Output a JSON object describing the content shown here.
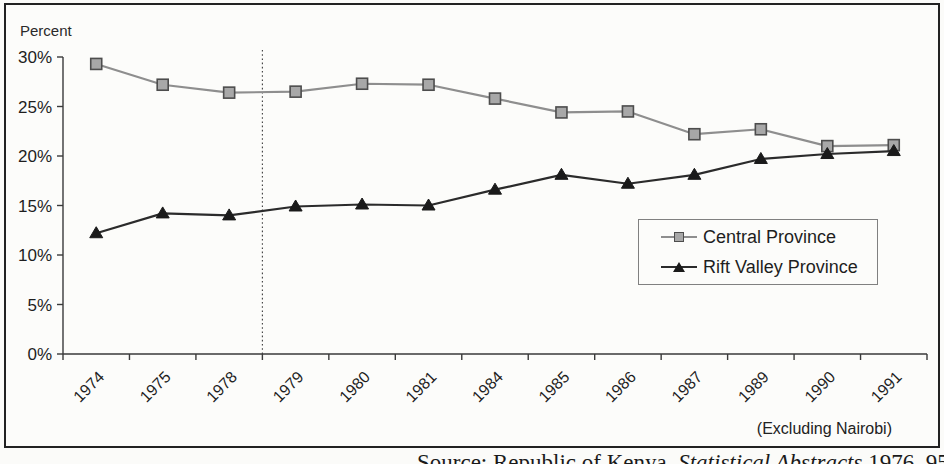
{
  "figure": {
    "y_axis_title": "Percent",
    "excluding_note": "(Excluding Nairobi)",
    "source_prefix": "Source: Republic of Kenya, ",
    "source_italic": "Statistical Abstracts",
    "source_suffix": " 1976–95"
  },
  "chart_data": {
    "type": "line",
    "categories": [
      "1974",
      "1975",
      "1978",
      "1979",
      "1980",
      "1981",
      "1984",
      "1985",
      "1986",
      "1987",
      "1989",
      "1990",
      "1991"
    ],
    "series": [
      {
        "name": "Central Province",
        "marker": "square",
        "line_color": "#8e8e8e",
        "marker_fill": "#a8a8a8",
        "marker_stroke": "#4d4d4d",
        "values": [
          29.3,
          27.2,
          26.4,
          26.5,
          27.3,
          27.2,
          25.8,
          24.4,
          24.5,
          22.2,
          22.7,
          21.0,
          21.1
        ]
      },
      {
        "name": "Rift Valley Province",
        "marker": "triangle",
        "line_color": "#2b2b2b",
        "marker_fill": "#1a1a1a",
        "marker_stroke": "#1a1a1a",
        "values": [
          12.2,
          14.2,
          14.0,
          14.9,
          15.1,
          15.0,
          16.6,
          18.1,
          17.2,
          18.1,
          19.7,
          20.2,
          20.5
        ]
      }
    ],
    "ylabel": "Percent",
    "ylim": [
      0,
      30
    ],
    "ytick_step": 5,
    "ytick_labels": [
      "0%",
      "5%",
      "10%",
      "15%",
      "20%",
      "25%",
      "30%"
    ],
    "x_tick_label_rotation_deg": -45,
    "divider_after_category": "1978",
    "legend_position": "inside-right",
    "grid": false,
    "axis_color": "#3a3a3a"
  }
}
